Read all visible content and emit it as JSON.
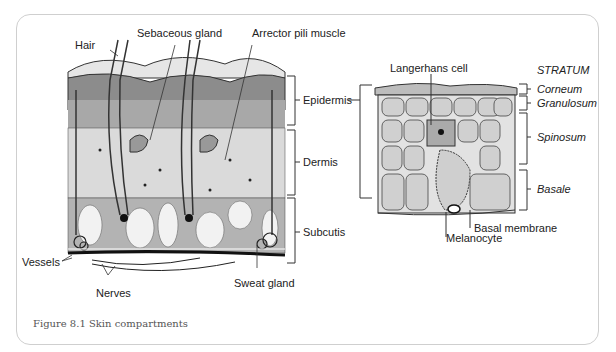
{
  "figure": {
    "caption": "Figure 8.1  Skin compartments"
  },
  "left_diagram": {
    "labels": {
      "hair": "Hair",
      "sebaceous_gland": "Sebaceous gland",
      "arrector_pili": "Arrector pili muscle",
      "epidermis": "Epidermis",
      "dermis": "Dermis",
      "subcutis": "Subcutis",
      "vessels": "Vessels",
      "nerves": "Nerves",
      "sweat_gland": "Sweat gland"
    }
  },
  "right_diagram": {
    "labels": {
      "langerhans": "Langerhans cell",
      "stratum": "STRATUM",
      "corneum": "Corneum",
      "granulosum": "Granulosum",
      "spinosum": "Spinosum",
      "basale": "Basale",
      "basal_membrane": "Basal membrane",
      "melanocyte": "Melanocyte"
    }
  },
  "colors": {
    "frame": "#cfcfcf",
    "epidermis_dark": "#8a8a8a",
    "dermis_light": "#d9d9d9",
    "subcutis": "#b5b5b5"
  }
}
